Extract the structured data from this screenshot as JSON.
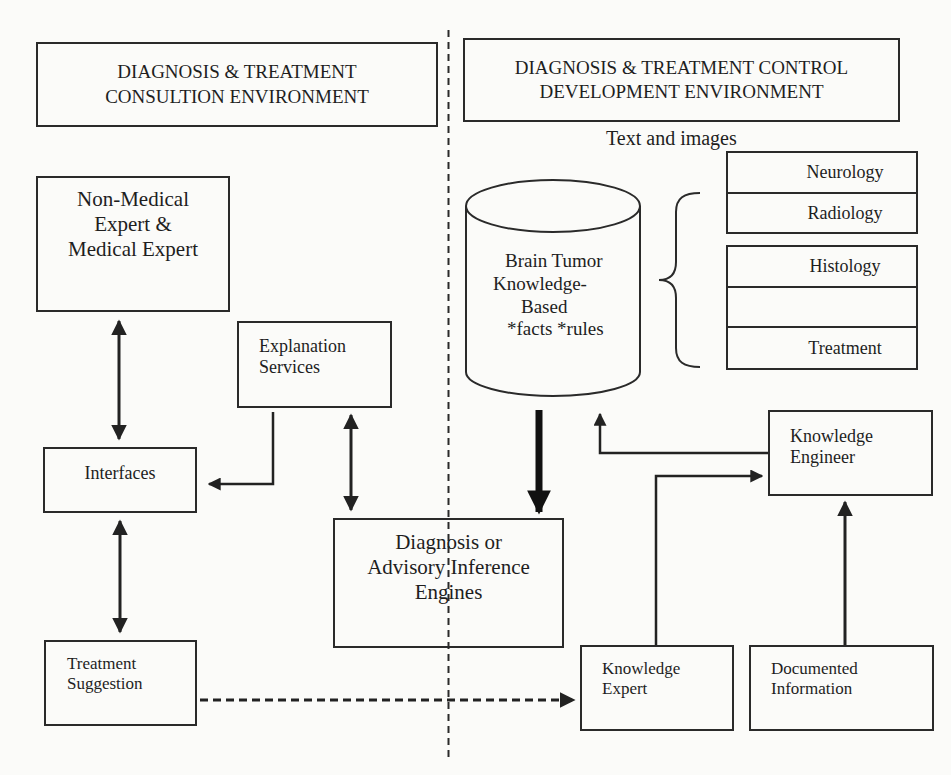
{
  "diagram": {
    "type": "architecture-flow",
    "sections": {
      "left": {
        "header_line1": "DIAGNOSIS & TREATMENT",
        "header_line2": "CONSULTION ENVIRONMENT"
      },
      "right": {
        "header_line1": "DIAGNOSIS & TREATMENT CONTROL",
        "header_line2": "DEVELOPMENT ENVIRONMENT",
        "caption": "Text and images"
      }
    },
    "nodes": {
      "users": {
        "line1": "Non-Medical",
        "line2": "Expert &",
        "line3": "Medical Expert"
      },
      "explanation": {
        "line1": "Explanation",
        "line2": "Services"
      },
      "interfaces": {
        "line1": "Interfaces"
      },
      "treatment_suggestion": {
        "line1": "Treatment",
        "line2": "Suggestion"
      },
      "inference": {
        "line1": "Diagnosis or",
        "line2": "Advisory Inference",
        "line3": "Engines"
      },
      "knowledge_base": {
        "line1": "Brain Tumor",
        "line2": "Knowledge-",
        "line3": "Based",
        "line4": "*facts *rules"
      },
      "knowledge_engineer": {
        "line1": "Knowledge",
        "line2": "Engineer"
      },
      "knowledge_expert": {
        "line1": "Knowledge",
        "line2": "Expert"
      },
      "documented_info": {
        "line1": "Documented",
        "line2": "Information"
      }
    },
    "knowledge_categories": [
      "Neurology",
      "Radiology",
      "Histology",
      "",
      "Treatment"
    ],
    "edges": [
      {
        "from": "users",
        "to": "interfaces",
        "style": "solid",
        "direction": "bidirectional"
      },
      {
        "from": "explanation",
        "to": "interfaces",
        "style": "solid",
        "direction": "forward"
      },
      {
        "from": "explanation",
        "to": "inference",
        "style": "solid",
        "direction": "bidirectional"
      },
      {
        "from": "interfaces",
        "to": "treatment_suggestion",
        "style": "solid",
        "direction": "bidirectional"
      },
      {
        "from": "knowledge_base",
        "to": "inference",
        "style": "thick",
        "direction": "forward"
      },
      {
        "from": "knowledge_engineer",
        "to": "knowledge_base",
        "style": "solid",
        "direction": "forward"
      },
      {
        "from": "knowledge_expert",
        "to": "knowledge_engineer",
        "style": "solid",
        "direction": "forward"
      },
      {
        "from": "documented_info",
        "to": "knowledge_engineer",
        "style": "solid",
        "direction": "forward"
      },
      {
        "from": "treatment_suggestion",
        "to": "knowledge_expert",
        "style": "dashed",
        "direction": "forward"
      }
    ],
    "colors": {
      "stroke": "#2a2a2a",
      "background": "#fbfbf9",
      "text": "#1e1e1e"
    }
  }
}
